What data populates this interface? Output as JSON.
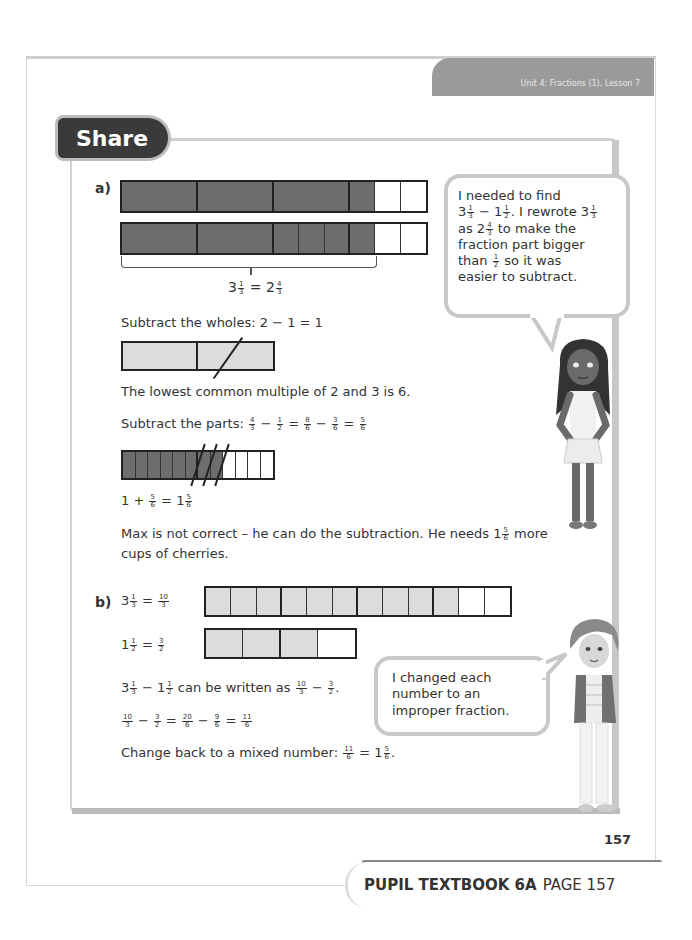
{
  "header": {
    "unit_banner": "Unit 4: Fractions (1), Lesson 7",
    "section_tab": "Share"
  },
  "part_a": {
    "label": "a)",
    "bar1": {
      "wholes": 4,
      "parts_per_whole": [
        1,
        1,
        1,
        3
      ],
      "shaded_parts": 4,
      "note": "3 1/3 shaded"
    },
    "bar2": {
      "wholes": 4,
      "parts_per_whole": [
        1,
        1,
        3,
        3
      ],
      "shaded_parts": 6,
      "note": "2 4/3 shaded"
    },
    "brace_equation": {
      "lhs_whole": "3",
      "lhs_num": "1",
      "lhs_den": "3",
      "eq": "=",
      "rhs_whole": "2",
      "rhs_num": "4",
      "rhs_den": "3"
    },
    "wholes_text": "Subtract the wholes: 2 − 1 = 1",
    "wholes_bar": {
      "cells": 2,
      "crossed": [
        2
      ]
    },
    "lcm_text": "The lowest common multiple of 2 and 3 is 6.",
    "parts_label": "Subtract the parts:",
    "parts_eq": [
      {
        "num": "4",
        "den": "3"
      },
      {
        "op": "−"
      },
      {
        "num": "1",
        "den": "2"
      },
      {
        "op": "="
      },
      {
        "num": "8",
        "den": "6"
      },
      {
        "op": "−"
      },
      {
        "num": "3",
        "den": "6"
      },
      {
        "op": "="
      },
      {
        "num": "5",
        "den": "6"
      }
    ],
    "sixths_bar": {
      "cells": 12,
      "shaded": 8,
      "crossed": [
        6,
        7,
        8
      ]
    },
    "sum_eq": {
      "a": "1",
      "op": "+",
      "num": "5",
      "den": "6",
      "eq": "=",
      "whole": "1",
      "rnum": "5",
      "rden": "6"
    },
    "conclusion_line1_pre": "Max is not correct – he can do the subtraction. He needs 1",
    "conclusion_num": "5",
    "conclusion_den": "6",
    "conclusion_line1_post": "more",
    "conclusion_line2": "cups of cherries."
  },
  "bubble_a": {
    "line1": "I needed to find",
    "line2_a": "3",
    "line2_a_num": "1",
    "line2_a_den": "3",
    "line2_op": "−",
    "line2_b": "1",
    "line2_b_num": "1",
    "line2_b_den": "2",
    "line2_rest": ". I rewrote 3",
    "line2_c_num": "1",
    "line2_c_den": "3",
    "line3_pre": "as 2",
    "line3_num": "4",
    "line3_den": "3",
    "line3_post": "to make the",
    "line4": "fraction part bigger",
    "line5_pre": "than",
    "line5_num": "1",
    "line5_den": "2",
    "line5_post": "so it was",
    "line6": "easier to subtract."
  },
  "part_b": {
    "label": "b)",
    "eq1": {
      "whole": "3",
      "num": "1",
      "den": "3",
      "eq": "=",
      "rnum": "10",
      "rden": "3"
    },
    "bar1": {
      "cells": 12,
      "group": 3,
      "shaded": 10
    },
    "eq2": {
      "whole": "1",
      "num": "1",
      "den": "2",
      "eq": "=",
      "rnum": "3",
      "rden": "2"
    },
    "bar2": {
      "cells": 4,
      "group": 2,
      "shaded": 3
    },
    "line3_pre_whole": "3",
    "line3_n1": "1",
    "line3_d1": "3",
    "line3_op": "−",
    "line3_whole2": "1",
    "line3_n2": "1",
    "line3_d2": "2",
    "line3_mid": "can be written as",
    "line3_n3": "10",
    "line3_d3": "3",
    "line3_n4": "3",
    "line3_d4": "2",
    "line4": [
      {
        "num": "10",
        "den": "3"
      },
      {
        "op": "−"
      },
      {
        "num": "3",
        "den": "2"
      },
      {
        "op": "="
      },
      {
        "num": "20",
        "den": "6"
      },
      {
        "op": "−"
      },
      {
        "num": "9",
        "den": "6"
      },
      {
        "op": "="
      },
      {
        "num": "11",
        "den": "6"
      }
    ],
    "line5_pre": "Change back to a mixed number:",
    "line5_n1": "11",
    "line5_d1": "6",
    "line5_eq": "=",
    "line5_whole": "1",
    "line5_n2": "5",
    "line5_d2": "6"
  },
  "bubble_b": {
    "line1": "I changed each",
    "line2": "number to an",
    "line3": "improper fraction."
  },
  "page_number": "157",
  "footer": {
    "bold": "PUPIL TEXTBOOK 6A",
    "normal": "PAGE 157"
  }
}
